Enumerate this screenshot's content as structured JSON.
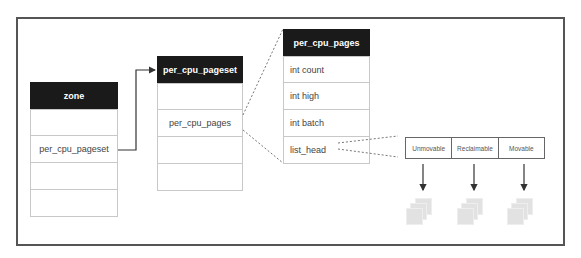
{
  "diagram": {
    "zone": {
      "title": "zone",
      "rows": [
        "",
        "per_cpu_pageset",
        "",
        ""
      ]
    },
    "per_cpu_pageset": {
      "title": "per_cpu_pageset",
      "rows": [
        "",
        "per_cpu_pages",
        "",
        ""
      ]
    },
    "per_cpu_pages": {
      "title": "per_cpu_pages",
      "rows": [
        "int count",
        "int high",
        "int batch",
        "list_head"
      ]
    },
    "migrate_types": [
      "Unmovable",
      "Reclaimable",
      "Movable"
    ],
    "colors": {
      "header_bg": "#1a1a1a",
      "header_text": "#ffffff",
      "row_border": "#c8c8c8",
      "frame_border": "#555555",
      "page_fill": "#e2e2e2"
    }
  }
}
